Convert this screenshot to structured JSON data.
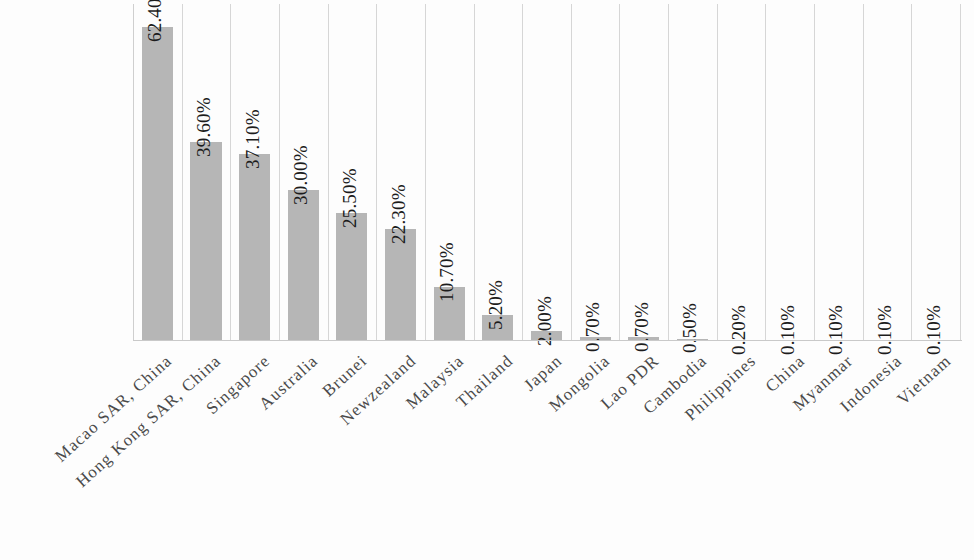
{
  "chart_data": {
    "type": "bar",
    "title": "",
    "subtitle": "",
    "xlabel": "",
    "ylabel": "",
    "grid": "vertical-category-separators",
    "legend": "none",
    "ylim": [
      0,
      67
    ],
    "value_label_suffix": "%",
    "categories": [
      "Macao SAR, China",
      "Hong Kong SAR, China",
      "Singapore",
      "Australia",
      "Brunei",
      "Newzealand",
      "Malaysia",
      "Thailand",
      "Japan",
      "Mongolia",
      "Lao PDR",
      "Cambodia",
      "Philippines",
      "China",
      "Myanmar",
      "Indonesia",
      "Vietnam"
    ],
    "values": [
      62.4,
      39.6,
      37.1,
      30.0,
      25.5,
      22.3,
      10.7,
      5.2,
      2.0,
      0.7,
      0.7,
      0.5,
      0.2,
      0.1,
      0.1,
      0.1,
      0.1
    ],
    "value_labels": [
      "62.40%",
      "39.60%",
      "37.10%",
      "30.00%",
      "25.50%",
      "22.30%",
      "10.70%",
      "5.20%",
      "2.00%",
      "0.70%",
      "0.70%",
      "0.50%",
      "0.20%",
      "0.10%",
      "0.10%",
      "0.10%",
      "0.10%"
    ]
  },
  "style": {
    "bar_color": "#b6b6b6",
    "gridline_color": "#d6d6d6",
    "baseline_color": "#c9c9c9",
    "value_label_color": "#1c1c1c",
    "category_label_color": "#4a4a4a",
    "background": "#fdfdfd"
  }
}
